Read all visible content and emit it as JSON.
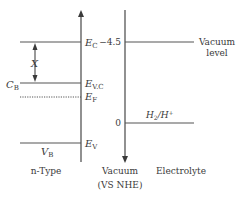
{
  "diagram": {
    "n_type": {
      "levels": {
        "E_C": {
          "main": "E",
          "sub": "C"
        },
        "E_VC": {
          "main": "E",
          "sub": "V.C"
        },
        "E_F": {
          "main": "E",
          "sub": "F"
        },
        "E_V": {
          "main": "E",
          "sub": "V"
        }
      },
      "X_label": "X",
      "C_B": {
        "main": "C",
        "sub": "B"
      },
      "V_B": {
        "main": "V",
        "sub": "B"
      },
      "caption": "n-Type"
    },
    "axis": {
      "tick_top": "−4.5",
      "tick_zero": "0",
      "caption_line1": "Vacuum",
      "caption_line2": "(VS NHE)"
    },
    "electrolyte": {
      "vacuum_level_line1": "Vacuum",
      "vacuum_level_line2": "level",
      "redox": {
        "main": "H",
        "sub": "2",
        "mid": "/H",
        "sup": "+"
      },
      "caption": "Electrolyte"
    },
    "colors": {
      "line": "#555555",
      "text": "#3a3a3a",
      "background": "#ffffff"
    }
  }
}
